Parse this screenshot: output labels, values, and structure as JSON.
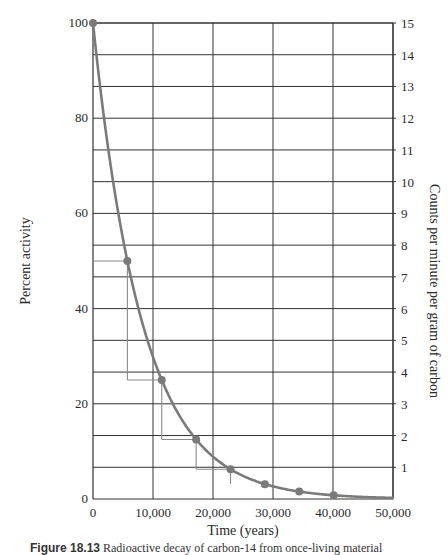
{
  "chart_data": {
    "type": "line",
    "title": "",
    "xlabel": "Time (years)",
    "ylabel": "Percent activity",
    "ylabel_right": "Counts per minute per gram of carbon",
    "xlim": [
      0,
      50000
    ],
    "ylim": [
      0,
      100
    ],
    "ylim_right": [
      0,
      15
    ],
    "x_ticks": [
      "0",
      "10,000",
      "20,000",
      "30,000",
      "40,000",
      "50,000"
    ],
    "y_ticks": [
      "0",
      "20",
      "40",
      "60",
      "80",
      "100"
    ],
    "y_right_ticks": [
      "1",
      "2",
      "3",
      "4",
      "5",
      "6",
      "7",
      "8",
      "9",
      "10",
      "11",
      "12",
      "13",
      "14",
      "15"
    ],
    "grid": true,
    "series": [
      {
        "name": "Carbon-14 decay curve",
        "x": [
          0,
          5730,
          11460,
          17190,
          22920,
          28650,
          34380,
          40110
        ],
        "y": [
          100,
          50,
          25,
          12.5,
          6.25,
          3.125,
          1.56,
          0.78
        ],
        "markers": true
      }
    ],
    "half_life_steps": [
      {
        "x": 5730,
        "y": 50
      },
      {
        "x": 11460,
        "y": 25
      },
      {
        "x": 17190,
        "y": 12.5
      },
      {
        "x": 22920,
        "y": 6.25
      }
    ],
    "colors": {
      "curve": "#7a7a7a",
      "grid": "#333333",
      "steps": "#8a8a8a"
    }
  },
  "caption": {
    "label": "Figure 18.13",
    "text": "Radioactive decay of carbon-14 from once-living material"
  }
}
